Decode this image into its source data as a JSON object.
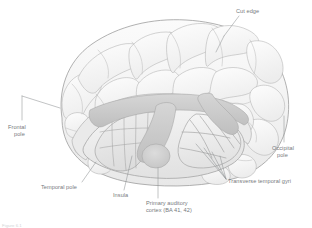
{
  "figure": {
    "background_color": "#ffffff",
    "credit": "Figure 6.1",
    "palette": {
      "cortex_fill": "#f2f2f2",
      "cortex_fill_light": "#f8f8f8",
      "cortex_outline": "#9a9a9a",
      "sulcus_line": "#b4b4b4",
      "cut_band_fill": "#c9c9c9",
      "cut_band_outline": "#a8a8a8",
      "insula_fill": "#e4e4e4",
      "auditory_fill": "#cfcfcf",
      "leader_line": "#8c8f92",
      "label_text": "#76797c"
    }
  },
  "labels": [
    {
      "id": "cut-edge",
      "name": "label-cut-edge",
      "text": "Cut edge",
      "lines": [
        "Cut edge"
      ],
      "x": 236,
      "y": 8,
      "align": "left"
    },
    {
      "id": "frontal-pole",
      "name": "label-frontal-pole",
      "text": "Frontal pole",
      "lines": [
        "Frontal",
        "pole"
      ],
      "x": 8,
      "y": 124,
      "align": "left"
    },
    {
      "id": "occipital-pole",
      "name": "label-occipital-pole",
      "text": "Occipital pole",
      "lines": [
        "Occipital",
        "pole"
      ],
      "x": 272,
      "y": 145,
      "align": "left"
    },
    {
      "id": "temporal-pole",
      "name": "label-temporal-pole",
      "text": "Temporal pole",
      "lines": [
        "Temporal pole"
      ],
      "x": 41,
      "y": 184,
      "align": "left"
    },
    {
      "id": "insula",
      "name": "label-insula",
      "text": "Insula",
      "lines": [
        "Insula"
      ],
      "x": 113,
      "y": 192,
      "align": "left"
    },
    {
      "id": "primary-auditory-cortex",
      "name": "label-primary-auditory-cortex",
      "text": "Primary auditory cortex (BA 41, 42)",
      "lines": [
        "Primary auditory",
        "cortex (BA 41, 42)"
      ],
      "x": 146,
      "y": 200,
      "align": "left"
    },
    {
      "id": "transverse-temporal-gyri",
      "name": "label-transverse-temporal-gyri",
      "text": "Transverse temporal gyri",
      "lines": [
        "Transverse temporal gyri"
      ],
      "x": 228,
      "y": 178,
      "align": "left"
    }
  ],
  "structures": [
    {
      "id": "cerebral-cortex",
      "name": "Cerebral cortex (lateral surface)"
    },
    {
      "id": "frontal-lobe",
      "name": "Frontal lobe"
    },
    {
      "id": "parietal-lobe",
      "name": "Parietal lobe"
    },
    {
      "id": "occipital-lobe",
      "name": "Occipital lobe"
    },
    {
      "id": "insula",
      "name": "Insula"
    },
    {
      "id": "superior-temporal-plane",
      "name": "Superior temporal plane"
    },
    {
      "id": "transverse-temporal-gyri",
      "name": "Transverse temporal gyri"
    },
    {
      "id": "primary-auditory-cortex",
      "name": "Primary auditory cortex (BA 41, 42)"
    },
    {
      "id": "cut-edge",
      "name": "Cut edge of temporal lobe"
    }
  ]
}
